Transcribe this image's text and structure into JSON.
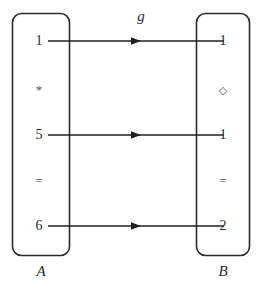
{
  "figure": {
    "map_label": "g",
    "left_set": {
      "name": "A",
      "elements": [
        {
          "text": "1",
          "kind": "value"
        },
        {
          "text": "*",
          "kind": "separator"
        },
        {
          "text": "5",
          "kind": "value"
        },
        {
          "text": "=",
          "kind": "separator"
        },
        {
          "text": "6",
          "kind": "value"
        }
      ]
    },
    "right_set": {
      "name": "B",
      "elements": [
        {
          "text": "1",
          "kind": "value"
        },
        {
          "text": "◇",
          "kind": "diamond"
        },
        {
          "text": "1",
          "kind": "value"
        },
        {
          "text": "=",
          "kind": "separator"
        },
        {
          "text": "2",
          "kind": "value"
        }
      ]
    },
    "arrows": [
      {
        "from": "1",
        "to": "1"
      },
      {
        "from": "5",
        "to": "1"
      },
      {
        "from": "6",
        "to": "2"
      }
    ],
    "colors": {
      "stroke": "#2b2b2b",
      "background": "#ffffff"
    }
  }
}
